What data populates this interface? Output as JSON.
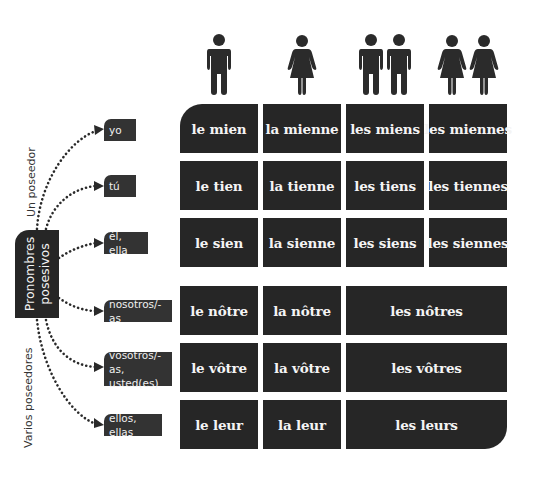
{
  "root": {
    "line1": "Pronombres",
    "line2": "posesivos"
  },
  "groups": {
    "singular": "Un poseedor",
    "plural": "Varios poseedores"
  },
  "column_icons": [
    {
      "name": "single-man-icon",
      "meaning": "masculine singular"
    },
    {
      "name": "single-woman-icon",
      "meaning": "feminine singular"
    },
    {
      "name": "two-men-icon",
      "meaning": "masculine plural"
    },
    {
      "name": "two-women-icon",
      "meaning": "feminine plural"
    }
  ],
  "rows": [
    {
      "person": "yo",
      "cells": [
        "le mien",
        "la mienne",
        "les miens",
        "les miennes"
      ]
    },
    {
      "person": "tú",
      "cells": [
        "le tien",
        "la tienne",
        "les tiens",
        "les tiennes"
      ]
    },
    {
      "person": "él, ella",
      "cells": [
        "le sien",
        "la sienne",
        "les siens",
        "les siennes"
      ]
    },
    {
      "person": "nosotros/-as",
      "cells": [
        "le nôtre",
        "la nôtre",
        "les nôtres"
      ]
    },
    {
      "person_line1": "vosotros/-as,",
      "person_line2": "usted(es)",
      "cells": [
        "le vôtre",
        "la vôtre",
        "les vôtres"
      ]
    },
    {
      "person": "ellos, ellas",
      "cells": [
        "le leur",
        "la leur",
        "les leurs"
      ]
    }
  ],
  "colors": {
    "cell_bg": "#262626",
    "label_bg": "#333333",
    "text": "#f4f4f4",
    "dots": "#2a2a2a"
  }
}
